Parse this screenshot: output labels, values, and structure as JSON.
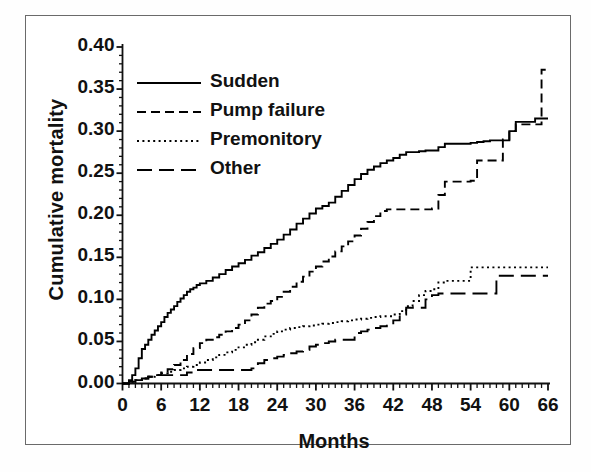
{
  "chart_data": {
    "type": "line",
    "title": "",
    "xlabel": "Months",
    "ylabel": "Cumulative mortality",
    "xlim": [
      0,
      66
    ],
    "ylim": [
      0,
      0.4
    ],
    "xticks": [
      0,
      6,
      12,
      18,
      24,
      30,
      36,
      42,
      48,
      54,
      60,
      66
    ],
    "xtick_labels": [
      "0",
      "6",
      "12",
      "18",
      "24",
      "30",
      "36",
      "42",
      "48",
      "54",
      "60",
      "66"
    ],
    "yticks": [
      0.0,
      0.05,
      0.1,
      0.15,
      0.2,
      0.25,
      0.3,
      0.35,
      0.4
    ],
    "ytick_labels": [
      "0.00",
      "0.05",
      "0.10",
      "0.15",
      "0.20",
      "0.25",
      "0.30",
      "0.35",
      "0.40"
    ],
    "x_minor_step": 1,
    "y_minor_step": 0.01,
    "grid": false,
    "legend_position": "upper-left",
    "step_style": "post",
    "series": [
      {
        "name": "Sudden",
        "style": "solid",
        "color": "#000000",
        "final_value": 0.315,
        "points": [
          [
            0,
            0.0
          ],
          [
            1,
            0.004
          ],
          [
            1.5,
            0.01
          ],
          [
            2,
            0.018
          ],
          [
            2.5,
            0.03
          ],
          [
            3,
            0.041
          ],
          [
            3.5,
            0.046
          ],
          [
            4,
            0.052
          ],
          [
            4.5,
            0.058
          ],
          [
            5,
            0.063
          ],
          [
            5.5,
            0.068
          ],
          [
            6,
            0.073
          ],
          [
            6.5,
            0.079
          ],
          [
            7,
            0.084
          ],
          [
            7.5,
            0.088
          ],
          [
            8,
            0.092
          ],
          [
            8.5,
            0.097
          ],
          [
            9,
            0.101
          ],
          [
            9.5,
            0.105
          ],
          [
            10,
            0.109
          ],
          [
            10.5,
            0.112
          ],
          [
            11,
            0.114
          ],
          [
            11.5,
            0.117
          ],
          [
            12,
            0.119
          ],
          [
            13,
            0.122
          ],
          [
            14,
            0.126
          ],
          [
            15,
            0.13
          ],
          [
            16,
            0.135
          ],
          [
            17,
            0.139
          ],
          [
            18,
            0.143
          ],
          [
            19,
            0.147
          ],
          [
            20,
            0.152
          ],
          [
            21,
            0.156
          ],
          [
            22,
            0.161
          ],
          [
            23,
            0.166
          ],
          [
            24,
            0.171
          ],
          [
            25,
            0.177
          ],
          [
            26,
            0.183
          ],
          [
            27,
            0.19
          ],
          [
            28,
            0.196
          ],
          [
            29,
            0.202
          ],
          [
            30,
            0.208
          ],
          [
            31,
            0.211
          ],
          [
            32,
            0.215
          ],
          [
            33,
            0.222
          ],
          [
            34,
            0.229
          ],
          [
            35,
            0.236
          ],
          [
            36,
            0.243
          ],
          [
            37,
            0.249
          ],
          [
            38,
            0.254
          ],
          [
            39,
            0.258
          ],
          [
            40,
            0.262
          ],
          [
            41,
            0.265
          ],
          [
            42,
            0.268
          ],
          [
            43,
            0.272
          ],
          [
            44,
            0.275
          ],
          [
            45,
            0.275
          ],
          [
            46,
            0.276
          ],
          [
            47,
            0.277
          ],
          [
            48,
            0.277
          ],
          [
            49,
            0.281
          ],
          [
            50,
            0.285
          ],
          [
            51,
            0.285
          ],
          [
            52,
            0.285
          ],
          [
            53,
            0.285
          ],
          [
            54,
            0.286
          ],
          [
            55,
            0.287
          ],
          [
            56,
            0.288
          ],
          [
            57,
            0.289
          ],
          [
            58,
            0.289
          ],
          [
            59,
            0.289
          ],
          [
            60,
            0.3
          ],
          [
            61,
            0.311
          ],
          [
            62,
            0.311
          ],
          [
            63,
            0.311
          ],
          [
            64,
            0.315
          ],
          [
            65,
            0.315
          ],
          [
            66,
            0.315
          ]
        ]
      },
      {
        "name": "Pump failure",
        "style": "dashed",
        "color": "#000000",
        "final_value": 0.373,
        "points": [
          [
            0,
            0.0
          ],
          [
            1,
            0.002
          ],
          [
            2,
            0.004
          ],
          [
            3,
            0.006
          ],
          [
            4,
            0.008
          ],
          [
            5,
            0.01
          ],
          [
            6,
            0.013
          ],
          [
            7,
            0.017
          ],
          [
            8,
            0.022
          ],
          [
            9,
            0.028
          ],
          [
            10,
            0.035
          ],
          [
            11,
            0.042
          ],
          [
            12,
            0.048
          ],
          [
            13,
            0.052
          ],
          [
            14,
            0.055
          ],
          [
            15,
            0.058
          ],
          [
            16,
            0.062
          ],
          [
            17,
            0.066
          ],
          [
            18,
            0.07
          ],
          [
            19,
            0.075
          ],
          [
            20,
            0.082
          ],
          [
            21,
            0.09
          ],
          [
            22,
            0.095
          ],
          [
            23,
            0.098
          ],
          [
            24,
            0.103
          ],
          [
            25,
            0.109
          ],
          [
            26,
            0.115
          ],
          [
            27,
            0.121
          ],
          [
            28,
            0.127
          ],
          [
            29,
            0.133
          ],
          [
            30,
            0.139
          ],
          [
            31,
            0.145
          ],
          [
            32,
            0.151
          ],
          [
            33,
            0.157
          ],
          [
            34,
            0.163
          ],
          [
            35,
            0.169
          ],
          [
            36,
            0.176
          ],
          [
            37,
            0.184
          ],
          [
            38,
            0.192
          ],
          [
            39,
            0.199
          ],
          [
            40,
            0.205
          ],
          [
            41,
            0.207
          ],
          [
            42,
            0.207
          ],
          [
            43,
            0.207
          ],
          [
            44,
            0.207
          ],
          [
            45,
            0.207
          ],
          [
            46,
            0.207
          ],
          [
            47,
            0.207
          ],
          [
            48,
            0.208
          ],
          [
            49,
            0.224
          ],
          [
            50,
            0.24
          ],
          [
            51,
            0.24
          ],
          [
            52,
            0.24
          ],
          [
            53,
            0.24
          ],
          [
            54,
            0.241
          ],
          [
            55,
            0.265
          ],
          [
            56,
            0.265
          ],
          [
            57,
            0.265
          ],
          [
            58,
            0.265
          ],
          [
            59,
            0.29
          ],
          [
            60,
            0.3
          ],
          [
            61,
            0.308
          ],
          [
            62,
            0.308
          ],
          [
            63,
            0.308
          ],
          [
            64,
            0.308
          ],
          [
            65,
            0.373
          ],
          [
            66,
            0.373
          ]
        ]
      },
      {
        "name": "Premonitory",
        "style": "dotted",
        "color": "#000000",
        "final_value": 0.138,
        "points": [
          [
            0,
            0.0
          ],
          [
            1,
            0.002
          ],
          [
            2,
            0.004
          ],
          [
            3,
            0.006
          ],
          [
            4,
            0.008
          ],
          [
            5,
            0.01
          ],
          [
            6,
            0.012
          ],
          [
            7,
            0.014
          ],
          [
            8,
            0.016
          ],
          [
            9,
            0.018
          ],
          [
            10,
            0.02
          ],
          [
            11,
            0.022
          ],
          [
            12,
            0.025
          ],
          [
            13,
            0.028
          ],
          [
            14,
            0.031
          ],
          [
            15,
            0.034
          ],
          [
            16,
            0.037
          ],
          [
            17,
            0.04
          ],
          [
            18,
            0.043
          ],
          [
            19,
            0.046
          ],
          [
            20,
            0.049
          ],
          [
            21,
            0.052
          ],
          [
            22,
            0.056
          ],
          [
            23,
            0.059
          ],
          [
            24,
            0.062
          ],
          [
            25,
            0.064
          ],
          [
            26,
            0.066
          ],
          [
            27,
            0.067
          ],
          [
            28,
            0.068
          ],
          [
            29,
            0.069
          ],
          [
            30,
            0.07
          ],
          [
            31,
            0.071
          ],
          [
            32,
            0.072
          ],
          [
            33,
            0.073
          ],
          [
            34,
            0.074
          ],
          [
            35,
            0.075
          ],
          [
            36,
            0.076
          ],
          [
            37,
            0.077
          ],
          [
            38,
            0.078
          ],
          [
            39,
            0.079
          ],
          [
            40,
            0.08
          ],
          [
            41,
            0.08
          ],
          [
            42,
            0.082
          ],
          [
            43,
            0.086
          ],
          [
            44,
            0.092
          ],
          [
            45,
            0.098
          ],
          [
            46,
            0.105
          ],
          [
            47,
            0.11
          ],
          [
            48,
            0.112
          ],
          [
            49,
            0.12
          ],
          [
            50,
            0.122
          ],
          [
            51,
            0.122
          ],
          [
            52,
            0.122
          ],
          [
            53,
            0.122
          ],
          [
            54,
            0.138
          ],
          [
            55,
            0.138
          ],
          [
            56,
            0.138
          ],
          [
            57,
            0.138
          ],
          [
            58,
            0.138
          ],
          [
            59,
            0.138
          ],
          [
            60,
            0.138
          ],
          [
            61,
            0.138
          ],
          [
            62,
            0.138
          ],
          [
            63,
            0.138
          ],
          [
            64,
            0.138
          ],
          [
            65,
            0.138
          ],
          [
            66,
            0.138
          ]
        ]
      },
      {
        "name": "Other",
        "style": "longdash",
        "color": "#000000",
        "final_value": 0.128,
        "points": [
          [
            0,
            0.0
          ],
          [
            1,
            0.002
          ],
          [
            2,
            0.004
          ],
          [
            3,
            0.006
          ],
          [
            4,
            0.008
          ],
          [
            5,
            0.01
          ],
          [
            6,
            0.01
          ],
          [
            7,
            0.01
          ],
          [
            8,
            0.01
          ],
          [
            9,
            0.01
          ],
          [
            10,
            0.013
          ],
          [
            11,
            0.016
          ],
          [
            12,
            0.016
          ],
          [
            13,
            0.016
          ],
          [
            14,
            0.016
          ],
          [
            15,
            0.016
          ],
          [
            16,
            0.016
          ],
          [
            17,
            0.016
          ],
          [
            18,
            0.016
          ],
          [
            19,
            0.016
          ],
          [
            20,
            0.018
          ],
          [
            21,
            0.024
          ],
          [
            22,
            0.028
          ],
          [
            23,
            0.03
          ],
          [
            24,
            0.032
          ],
          [
            25,
            0.034
          ],
          [
            26,
            0.036
          ],
          [
            27,
            0.038
          ],
          [
            28,
            0.04
          ],
          [
            29,
            0.044
          ],
          [
            30,
            0.046
          ],
          [
            31,
            0.048
          ],
          [
            32,
            0.05
          ],
          [
            33,
            0.052
          ],
          [
            34,
            0.052
          ],
          [
            35,
            0.052
          ],
          [
            36,
            0.06
          ],
          [
            37,
            0.062
          ],
          [
            38,
            0.064
          ],
          [
            39,
            0.066
          ],
          [
            40,
            0.068
          ],
          [
            41,
            0.07
          ],
          [
            42,
            0.075
          ],
          [
            43,
            0.082
          ],
          [
            44,
            0.09
          ],
          [
            45,
            0.09
          ],
          [
            46,
            0.09
          ],
          [
            47,
            0.1
          ],
          [
            48,
            0.105
          ],
          [
            49,
            0.107
          ],
          [
            50,
            0.107
          ],
          [
            51,
            0.107
          ],
          [
            52,
            0.107
          ],
          [
            53,
            0.107
          ],
          [
            54,
            0.107
          ],
          [
            55,
            0.107
          ],
          [
            56,
            0.107
          ],
          [
            57,
            0.107
          ],
          [
            58,
            0.128
          ],
          [
            59,
            0.128
          ],
          [
            60,
            0.128
          ],
          [
            61,
            0.128
          ],
          [
            62,
            0.128
          ],
          [
            63,
            0.128
          ],
          [
            64,
            0.128
          ],
          [
            65,
            0.128
          ],
          [
            66,
            0.128
          ]
        ]
      }
    ],
    "legend": [
      {
        "label": "Sudden",
        "style": "solid"
      },
      {
        "label": "Pump failure",
        "style": "dashed"
      },
      {
        "label": "Premonitory",
        "style": "dotted"
      },
      {
        "label": "Other",
        "style": "longdash"
      }
    ]
  }
}
